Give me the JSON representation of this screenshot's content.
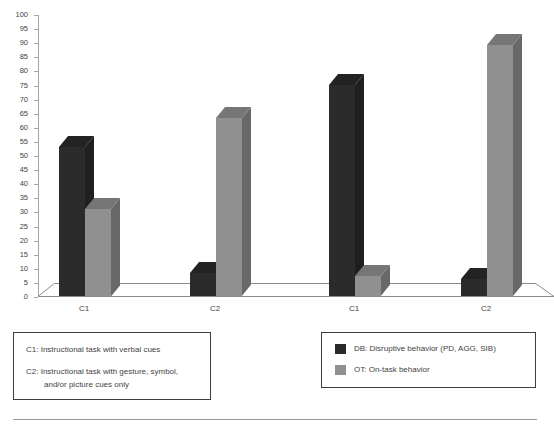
{
  "chart_data": {
    "type": "bar",
    "title": "",
    "xlabel": "",
    "ylabel": "",
    "ylim": [
      0,
      100
    ],
    "ytick_step": 5,
    "yticks": [
      100,
      95,
      90,
      85,
      80,
      75,
      70,
      65,
      60,
      55,
      50,
      45,
      40,
      35,
      30,
      25,
      20,
      15,
      10,
      5,
      0
    ],
    "grid": false,
    "legend_position": "bottom-right",
    "style": "3d-clustered-column",
    "categories": [
      "C1",
      "C2",
      "C1",
      "C2"
    ],
    "series": [
      {
        "name": "DB: Disruptive behavior (PD, AGG, SIB)",
        "short": "DB",
        "color": "#2b2b2b",
        "values": [
          53,
          8,
          75,
          6
        ]
      },
      {
        "name": "OT: On-task behavior",
        "short": "OT",
        "color": "#909090",
        "values": [
          31,
          63,
          7,
          89
        ]
      }
    ]
  },
  "axis": {
    "y_tick_labels": [
      "100",
      "95",
      "90",
      "85",
      "80",
      "75",
      "70",
      "65",
      "60",
      "55",
      "50",
      "45",
      "40",
      "35",
      "30",
      "25",
      "20",
      "15",
      "10",
      "5",
      "0"
    ],
    "x_tick_labels": [
      "C1",
      "C2",
      "C1",
      "C2"
    ]
  },
  "notes_box": {
    "line1": "C1: Instructional task with verbal  cues",
    "line2": "C2: Instructional task  with gesture, symbol,",
    "line3": "and/or picture cues only"
  },
  "legend": {
    "items": [
      {
        "label": "DB: Disruptive behavior (PD, AGG, SIB)",
        "color": "#2b2b2b",
        "swatch": "legend-swatch-db"
      },
      {
        "label": "OT: On-task behavior",
        "color": "#909090",
        "swatch": "legend-swatch-ot"
      }
    ]
  },
  "colors": {
    "series_db": "#2b2b2b",
    "series_ot": "#909090",
    "axis": "#a6a6a6",
    "text": "#3f3f3f",
    "box_border": "#3d3d3d",
    "rule": "#9a9a9a"
  }
}
